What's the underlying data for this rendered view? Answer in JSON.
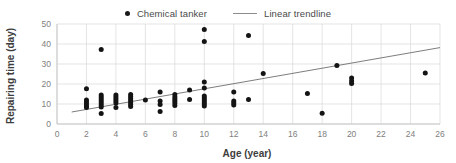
{
  "chart_data": {
    "type": "scatter",
    "title": "",
    "xlabel": "Age (year)",
    "ylabel": "Repairing time (day)",
    "xlim": [
      0,
      26
    ],
    "ylim": [
      0,
      50
    ],
    "xticks": [
      0,
      2,
      4,
      6,
      8,
      10,
      12,
      14,
      16,
      18,
      20,
      22,
      24,
      26
    ],
    "yticks": [
      0,
      10,
      20,
      30,
      40,
      50
    ],
    "grid": "horizontal-and-vertical",
    "legend_position": "top-center",
    "series": [
      {
        "name": "Chemical tanker",
        "type": "scatter",
        "marker": "circle",
        "color": "#141414",
        "points": [
          [
            2,
            17.6
          ],
          [
            2,
            12.0
          ],
          [
            2,
            11.0
          ],
          [
            2,
            10.0
          ],
          [
            2,
            9.0
          ],
          [
            2,
            8.2
          ],
          [
            3,
            37.3
          ],
          [
            3,
            14.5
          ],
          [
            3,
            13.5
          ],
          [
            3,
            12.5
          ],
          [
            3,
            11.5
          ],
          [
            3,
            10.5
          ],
          [
            3,
            9.5
          ],
          [
            3,
            8.5
          ],
          [
            3,
            5.3
          ],
          [
            4,
            14.5
          ],
          [
            4,
            13.5
          ],
          [
            4,
            12.5
          ],
          [
            4,
            11.5
          ],
          [
            4,
            10.5
          ],
          [
            4,
            8.2
          ],
          [
            5,
            14.8
          ],
          [
            5,
            13.8
          ],
          [
            5,
            12.8
          ],
          [
            5,
            11.8
          ],
          [
            5,
            10.8
          ],
          [
            5,
            9.8
          ],
          [
            5,
            8.8
          ],
          [
            6,
            12.0
          ],
          [
            7,
            16.0
          ],
          [
            7,
            11.5
          ],
          [
            7,
            9.8
          ],
          [
            7,
            6.2
          ],
          [
            8,
            14.8
          ],
          [
            8,
            13.5
          ],
          [
            8,
            12.5
          ],
          [
            8,
            11.5
          ],
          [
            8,
            10.5
          ],
          [
            8,
            9.2
          ],
          [
            9,
            17.0
          ],
          [
            9,
            12.2
          ],
          [
            10,
            47.2
          ],
          [
            10,
            41.2
          ],
          [
            10,
            21.0
          ],
          [
            10,
            18.0
          ],
          [
            10,
            14.0
          ],
          [
            10,
            13.0
          ],
          [
            10,
            12.0
          ],
          [
            10,
            11.0
          ],
          [
            10,
            10.0
          ],
          [
            10,
            9.0
          ],
          [
            12,
            16.0
          ],
          [
            12,
            11.5
          ],
          [
            12,
            10.5
          ],
          [
            12,
            9.5
          ],
          [
            13,
            44.3
          ],
          [
            13,
            12.2
          ],
          [
            14,
            25.2
          ],
          [
            17,
            15.3
          ],
          [
            18,
            5.4
          ],
          [
            19,
            29.3
          ],
          [
            20,
            23.0
          ],
          [
            20,
            21.5
          ],
          [
            20,
            20.3
          ],
          [
            25,
            25.5
          ]
        ]
      },
      {
        "name": "Linear trendline",
        "type": "line",
        "color": "#6e6e6e",
        "x_start": 1.0,
        "y_start": 6.0,
        "x_end": 26.0,
        "y_end": 38.2
      }
    ]
  },
  "legend": {
    "entries": [
      {
        "label": "Chemical tanker",
        "marker": "dot"
      },
      {
        "label": "Linear trendline",
        "marker": "line"
      }
    ]
  },
  "axes": {
    "x_title": "Age (year)",
    "y_title": "Repairing time (day)"
  },
  "colors": {
    "point": "#141414",
    "trendline": "#6e6e6e",
    "grid": "#d9d9d9",
    "tick_text": "#808080",
    "title_text": "#3d3d3d",
    "background": "#ffffff"
  }
}
